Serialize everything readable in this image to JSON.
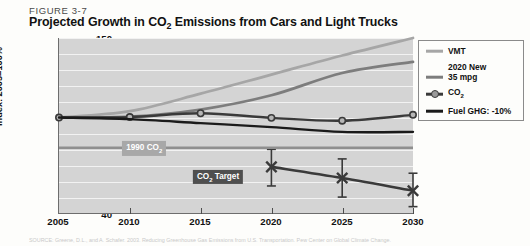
{
  "figure": {
    "number": "FIGURE 3-7",
    "title_parts": {
      "before": "Projected Growth in CO",
      "sub": "2",
      "after": " Emissions from Cars and Light Trucks"
    },
    "title_plain": "Projected Growth in CO2 Emissions from Cars and Light Trucks"
  },
  "annotations": {
    "line_1990": {
      "label_before": "1990 CO",
      "label_sub": "2",
      "value": 81
    },
    "co2_target": {
      "label_before": "CO",
      "label_sub": "2",
      "label_after": " Target"
    }
  },
  "legend": {
    "position": "right",
    "items": [
      {
        "label": "VMT",
        "color": "#a6a6a6",
        "marker": "line"
      },
      {
        "label_line1": "2020 New",
        "label_line2": "35 mpg",
        "color": "#7d7d7d",
        "marker": "line"
      },
      {
        "label_before": "CO",
        "label_sub": "2",
        "color": "#3a3a3a",
        "marker": "line-circle"
      },
      {
        "label": "Fuel GHG: -10%",
        "color": "#1a1a1a",
        "marker": "line"
      }
    ]
  },
  "footnote": "SOURCE: Greene, D.L., and A. Schafer. 2003. Reducing Greenhouse Gas Emissions from U.S. Transportation. Pew Center on Global Climate Change.",
  "chart_data": {
    "type": "line",
    "title": "Projected Growth in CO2 Emissions from Cars and Light Trucks",
    "xlabel": "",
    "ylabel": "Index: 2005=100%",
    "x": [
      2005,
      2010,
      2015,
      2020,
      2025,
      2030
    ],
    "xlim": [
      2005,
      2030
    ],
    "ylim": [
      40,
      150
    ],
    "yticks": [
      40,
      50,
      60,
      70,
      80,
      90,
      100,
      110,
      120,
      130,
      140,
      150
    ],
    "xticks": [
      2005,
      2010,
      2015,
      2020,
      2025,
      2030
    ],
    "grid": true,
    "legend_position": "right",
    "series": [
      {
        "name": "VMT",
        "color": "#a6a6a6",
        "values": [
          100,
          104,
          115,
          127,
          139,
          150
        ]
      },
      {
        "name": "2020 New 35 mpg",
        "color": "#7d7d7d",
        "values": [
          100,
          100.5,
          105,
          114,
          128,
          135
        ]
      },
      {
        "name": "CO2",
        "color": "#3a3a3a",
        "marker": "circle",
        "values": [
          100,
          100.3,
          102.7,
          99.8,
          98,
          101.7
        ]
      },
      {
        "name": "Fuel GHG: -10%",
        "color": "#1a1a1a",
        "values": [
          100,
          99,
          96.5,
          94,
          91,
          91
        ]
      },
      {
        "name": "CO2 Target",
        "color": "#3a3a3a",
        "marker": "x",
        "x": [
          2020,
          2025,
          2030
        ],
        "values": [
          69,
          62,
          54
        ],
        "error_high": [
          80,
          74,
          65
        ],
        "error_low": [
          57,
          50,
          44
        ]
      },
      {
        "name": "1990 CO2",
        "color": "#8f8f8f",
        "type": "hline",
        "value": 81
      }
    ]
  }
}
